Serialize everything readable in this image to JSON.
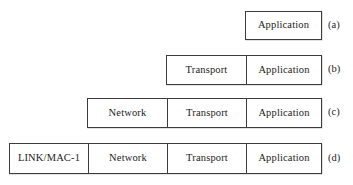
{
  "figure": {
    "background_color": "#ffffff",
    "border_color": "#3c3c3c",
    "text_color": "#1c1c1c",
    "layer_names": {
      "link": "LINK/MAC-1",
      "network": "Network",
      "transport": "Transport",
      "application": "Application"
    },
    "rows": [
      {
        "label": "(a)",
        "cells": [
          {
            "text": "Application"
          }
        ]
      },
      {
        "label": "(b)",
        "cells": [
          {
            "text": "Transport"
          },
          {
            "text": "Application"
          }
        ]
      },
      {
        "label": "(c)",
        "cells": [
          {
            "text": "Network"
          },
          {
            "text": "Transport"
          },
          {
            "text": "Application"
          }
        ]
      },
      {
        "label": "(d)",
        "cells": [
          {
            "text": "LINK/MAC-1"
          },
          {
            "text": "Network"
          },
          {
            "text": "Transport"
          },
          {
            "text": "Application"
          }
        ]
      }
    ]
  }
}
